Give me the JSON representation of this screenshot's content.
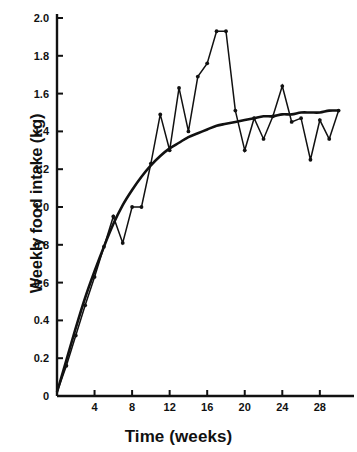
{
  "chart_data": {
    "type": "line",
    "title": "",
    "subtitle": "",
    "xlabel": "Time (weeks)",
    "ylabel": "Weekly food intake (kg)",
    "xlim": [
      0,
      30
    ],
    "ylim": [
      0,
      2.0
    ],
    "grid": false,
    "legend": null,
    "x_ticks": [
      4,
      8,
      12,
      16,
      20,
      24,
      28
    ],
    "x_tick_labels": [
      "4",
      "8",
      "12",
      "16",
      "20",
      "24",
      "28"
    ],
    "y_ticks": [
      0,
      0.2,
      0.4,
      0.6,
      0.8,
      1.0,
      1.2,
      1.4,
      1.6,
      1.8,
      2.0
    ],
    "y_tick_labels": [
      "0",
      "0.2",
      "0.4",
      "0.6",
      "0.8",
      "1.0",
      "1.2",
      "1.4",
      "1.6",
      "1.8",
      "2.0"
    ],
    "series": [
      {
        "name": "Observed weekly food intake",
        "type": "line-with-markers",
        "color": "#111111",
        "markers": true,
        "x": [
          0,
          1,
          2,
          3,
          4,
          5,
          6,
          7,
          8,
          9,
          10,
          11,
          12,
          13,
          14,
          15,
          16,
          17,
          18,
          19,
          20,
          21,
          22,
          23,
          24,
          25,
          26,
          27,
          28,
          29,
          30
        ],
        "y": [
          0.02,
          0.16,
          0.32,
          0.48,
          0.63,
          0.79,
          0.95,
          0.81,
          1.0,
          1.0,
          1.23,
          1.49,
          1.3,
          1.63,
          1.4,
          1.69,
          1.76,
          1.93,
          1.93,
          1.51,
          1.3,
          1.47,
          1.36,
          1.48,
          1.64,
          1.45,
          1.47,
          1.25,
          1.46,
          1.36,
          1.51
        ]
      },
      {
        "name": "Fitted monomolecular growth curve",
        "type": "smooth-curve",
        "color": "#111111",
        "markers": false,
        "x": [
          0,
          1,
          2,
          3,
          4,
          5,
          6,
          7,
          8,
          9,
          10,
          11,
          12,
          13,
          14,
          15,
          16,
          17,
          18,
          19,
          20,
          21,
          22,
          23,
          24,
          25,
          26,
          27,
          28,
          29,
          30
        ],
        "y": [
          0.02,
          0.19,
          0.36,
          0.52,
          0.66,
          0.79,
          0.91,
          1.01,
          1.09,
          1.16,
          1.22,
          1.27,
          1.31,
          1.34,
          1.37,
          1.39,
          1.41,
          1.43,
          1.44,
          1.45,
          1.46,
          1.47,
          1.48,
          1.48,
          1.49,
          1.49,
          1.5,
          1.5,
          1.5,
          1.51,
          1.51
        ]
      }
    ]
  },
  "axes": {
    "y_axis_title": "Weekly food intake (kg)",
    "x_axis_title": "Time (weeks)"
  }
}
